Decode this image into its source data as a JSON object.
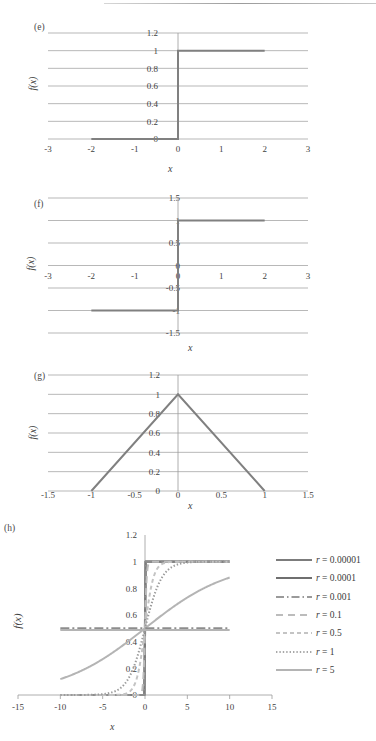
{
  "figure": {
    "panels": [
      {
        "label": "(e)",
        "xlabel": "x",
        "ylabel": "f(x)",
        "chart_data": {
          "type": "line",
          "title": "(e)",
          "xlabel": "x",
          "ylabel": "f(x)",
          "xlim": [
            -3,
            3
          ],
          "ylim": [
            0,
            1.2
          ],
          "xticks": [
            "-3",
            "-2",
            "-1",
            "0",
            "1",
            "2",
            "3"
          ],
          "xtick_values": [
            -3,
            -2,
            -1,
            0,
            1,
            2,
            3
          ],
          "yticks": [
            "0",
            "0.2",
            "0.4",
            "0.6",
            "0.8",
            "1",
            "1.2"
          ],
          "ytick_values": [
            0,
            0.2,
            0.4,
            0.6,
            0.8,
            1,
            1.2
          ],
          "grid": true,
          "legend": "none",
          "series": [
            {
              "name": "unit step",
              "points": [
                [
                  -2,
                  0
                ],
                [
                  0,
                  0
                ],
                [
                  0,
                  1
                ],
                [
                  2,
                  1
                ]
              ],
              "style": "solid",
              "color": "#808080"
            }
          ]
        }
      },
      {
        "label": "(f)",
        "xlabel": "x",
        "ylabel": "f(x)",
        "chart_data": {
          "type": "line",
          "title": "(f)",
          "xlabel": "x",
          "ylabel": "f(x)",
          "xlim": [
            -3,
            3
          ],
          "ylim": [
            -1.5,
            1.5
          ],
          "xticks": [
            "-3",
            "-2",
            "-1",
            "0",
            "1",
            "2",
            "3"
          ],
          "xtick_values": [
            -3,
            -2,
            -1,
            0,
            1,
            2,
            3
          ],
          "yticks": [
            "-1.5",
            "-1",
            "-0.5",
            "0",
            "0.5",
            "1",
            "1.5"
          ],
          "ytick_values": [
            -1.5,
            -1,
            -0.5,
            0,
            0.5,
            1,
            1.5
          ],
          "grid": true,
          "legend": "none",
          "series": [
            {
              "name": "signum",
              "points": [
                [
                  -2,
                  -1
                ],
                [
                  0,
                  -1
                ],
                [
                  0,
                  1
                ],
                [
                  2,
                  1
                ]
              ],
              "style": "solid",
              "color": "#808080"
            }
          ]
        }
      },
      {
        "label": "(g)",
        "xlabel": "x",
        "ylabel": "f(x)",
        "chart_data": {
          "type": "line",
          "title": "(g)",
          "xlabel": "x",
          "ylabel": "f(x)",
          "xlim": [
            -1.5,
            1.5
          ],
          "ylim": [
            0,
            1.2
          ],
          "xticks": [
            "-1.5",
            "-1",
            "-0.5",
            "0",
            "0.5",
            "1",
            "1.5"
          ],
          "xtick_values": [
            -1.5,
            -1,
            -0.5,
            0,
            0.5,
            1,
            1.5
          ],
          "yticks": [
            "0",
            "0.2",
            "0.4",
            "0.6",
            "0.8",
            "1",
            "1.2"
          ],
          "ytick_values": [
            0,
            0.2,
            0.4,
            0.6,
            0.8,
            1,
            1.2
          ],
          "grid": true,
          "legend": "none",
          "series": [
            {
              "name": "triangle",
              "points": [
                [
                  -1,
                  0
                ],
                [
                  0,
                  1
                ],
                [
                  1,
                  0
                ]
              ],
              "style": "solid",
              "color": "#808080"
            }
          ]
        }
      },
      {
        "label": "(h)",
        "xlabel": "x",
        "ylabel": "f(x)",
        "chart_data": {
          "type": "line",
          "title": "(h)",
          "xlabel": "x",
          "ylabel": "f(x)",
          "xlim": [
            -15,
            15
          ],
          "ylim": [
            0,
            1.2
          ],
          "xticks": [
            "-15",
            "-10",
            "-5",
            "0",
            "5",
            "10",
            "15"
          ],
          "xtick_values": [
            -15,
            -10,
            -5,
            0,
            5,
            10,
            15
          ],
          "yticks": [
            "0",
            "0.2",
            "0.4",
            "0.6",
            "0.8",
            "1",
            "1.2"
          ],
          "ytick_values": [
            0,
            0.2,
            0.4,
            0.6,
            0.8,
            1,
            1.2
          ],
          "grid": false,
          "legend": "right",
          "note": "logistic sigmoid f(x)=1/(1+exp(-x/r)) plotted for x in [-10,10]",
          "series": [
            {
              "name": "r = 0.00001",
              "r": 1e-05,
              "style": "solid",
              "color": "#7c7c7c"
            },
            {
              "name": "r = 0.0001",
              "r": 0.0001,
              "style": "solid",
              "color": "#7c7c7c"
            },
            {
              "name": "r = 0.001",
              "r": 0.001,
              "style": "dashdot",
              "color": "#8d8d8d"
            },
            {
              "name": "r = 0.1",
              "r": 0.1,
              "style": "dashed",
              "color": "#bcbcbc"
            },
            {
              "name": "r = 0.5",
              "r": 0.5,
              "style": "smalldash",
              "color": "#c4c4c4"
            },
            {
              "name": "r = 1",
              "r": 1,
              "style": "dotted",
              "color": "#9a9a9a"
            },
            {
              "name": "r = 5",
              "r": 5,
              "style": "solid",
              "color": "#b4b4b4"
            }
          ]
        }
      }
    ],
    "legend": {
      "entries": [
        {
          "label": "r = 0.00001",
          "prefix": "r",
          "value": "= 0.00001",
          "style": "solid",
          "color": "#7c7c7c"
        },
        {
          "label": "r = 0.0001",
          "prefix": "r",
          "value": "= 0.0001",
          "style": "solid",
          "color": "#6f6f6f"
        },
        {
          "label": "r = 0.001",
          "prefix": "r",
          "value": "= 0.001",
          "style": "dashdot",
          "color": "#9a9a9a"
        },
        {
          "label": "r = 0.1",
          "prefix": "r",
          "value": "= 0.1",
          "style": "dashed",
          "color": "#bcbcbc"
        },
        {
          "label": "r = 0.5",
          "prefix": "r",
          "value": "= 0.5",
          "style": "smalldash",
          "color": "#c4c4c4"
        },
        {
          "label": "r = 1",
          "prefix": "r",
          "value": "= 1",
          "style": "dotted",
          "color": "#a8a8a8"
        },
        {
          "label": "r = 5",
          "prefix": "r",
          "value": "= 5",
          "style": "solid",
          "color": "#b4b4b4"
        }
      ]
    }
  }
}
